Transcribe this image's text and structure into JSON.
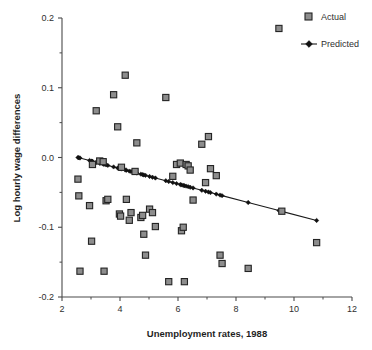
{
  "chart_data": {
    "type": "scatter",
    "title": "",
    "xlabel": "Unemployment rates, 1988",
    "ylabel": "Log hourly wage differences",
    "xlim": [
      2,
      12
    ],
    "ylim": [
      -0.2,
      0.2
    ],
    "xticks": [
      2,
      4,
      6,
      8,
      10,
      12
    ],
    "xtick_labels": [
      "2",
      "4",
      "6",
      "8",
      "10",
      "12"
    ],
    "yticks": [
      -0.2,
      -0.1,
      0.0,
      0.1,
      0.2
    ],
    "ytick_labels": [
      "-0.2",
      "-0.1",
      "0.0",
      "0.1",
      "0.2"
    ],
    "yminor_ticks": [
      -0.15,
      -0.05,
      0.05,
      0.15
    ],
    "xminor_ticks": [
      3,
      5,
      7,
      9,
      11
    ],
    "grid": false,
    "legend_position": "top-right",
    "series": [
      {
        "name": "Actual",
        "type": "scatter",
        "marker": "square",
        "marker_color": "#8d8d8d",
        "marker_edge_color": "#242424",
        "points": [
          [
            2.55,
            -0.031
          ],
          [
            2.58,
            -0.055
          ],
          [
            2.62,
            -0.163
          ],
          [
            2.95,
            -0.069
          ],
          [
            3.02,
            -0.12
          ],
          [
            3.05,
            -0.01
          ],
          [
            3.18,
            0.067
          ],
          [
            3.3,
            -0.005
          ],
          [
            3.42,
            -0.006
          ],
          [
            3.45,
            -0.163
          ],
          [
            3.52,
            -0.062
          ],
          [
            3.58,
            -0.06
          ],
          [
            3.78,
            0.09
          ],
          [
            3.92,
            0.044
          ],
          [
            3.98,
            -0.081
          ],
          [
            4.02,
            -0.084
          ],
          [
            4.05,
            -0.014
          ],
          [
            4.18,
            0.118
          ],
          [
            4.22,
            -0.06
          ],
          [
            4.32,
            -0.09
          ],
          [
            4.38,
            -0.079
          ],
          [
            4.52,
            -0.02
          ],
          [
            4.58,
            0.021
          ],
          [
            4.72,
            -0.086
          ],
          [
            4.78,
            -0.083
          ],
          [
            4.82,
            -0.11
          ],
          [
            4.88,
            -0.14
          ],
          [
            5.02,
            -0.074
          ],
          [
            5.12,
            -0.079
          ],
          [
            5.22,
            -0.099
          ],
          [
            5.58,
            0.086
          ],
          [
            5.68,
            -0.178
          ],
          [
            5.82,
            -0.027
          ],
          [
            5.95,
            -0.01
          ],
          [
            6.08,
            -0.008
          ],
          [
            6.12,
            -0.105
          ],
          [
            6.18,
            -0.1
          ],
          [
            6.22,
            -0.178
          ],
          [
            6.28,
            -0.01
          ],
          [
            6.35,
            -0.012
          ],
          [
            6.42,
            -0.018
          ],
          [
            6.52,
            -0.061
          ],
          [
            6.82,
            0.019
          ],
          [
            6.95,
            -0.036
          ],
          [
            7.05,
            0.03
          ],
          [
            7.12,
            -0.016
          ],
          [
            7.32,
            -0.026
          ],
          [
            7.45,
            -0.14
          ],
          [
            7.52,
            -0.152
          ],
          [
            8.42,
            -0.159
          ],
          [
            9.48,
            0.185
          ],
          [
            9.58,
            -0.077
          ],
          [
            10.78,
            -0.122
          ]
        ]
      },
      {
        "name": "Predicted",
        "type": "line",
        "marker": "diamond",
        "line_color": "#1a1a1a",
        "points": [
          [
            2.55,
            0.0
          ],
          [
            2.58,
            -0.0003
          ],
          [
            2.62,
            -0.0007
          ],
          [
            2.95,
            -0.0043
          ],
          [
            3.02,
            -0.0051
          ],
          [
            3.05,
            -0.0054
          ],
          [
            3.18,
            -0.0068
          ],
          [
            3.3,
            -0.0082
          ],
          [
            3.42,
            -0.0095
          ],
          [
            3.45,
            -0.0098
          ],
          [
            3.52,
            -0.0106
          ],
          [
            3.58,
            -0.0113
          ],
          [
            3.78,
            -0.0135
          ],
          [
            3.92,
            -0.015
          ],
          [
            3.98,
            -0.0157
          ],
          [
            4.02,
            -0.0161
          ],
          [
            4.05,
            -0.0165
          ],
          [
            4.18,
            -0.0179
          ],
          [
            4.22,
            -0.0183
          ],
          [
            4.32,
            -0.0195
          ],
          [
            4.38,
            -0.0201
          ],
          [
            4.52,
            -0.0217
          ],
          [
            4.58,
            -0.0223
          ],
          [
            4.72,
            -0.0239
          ],
          [
            4.78,
            -0.0245
          ],
          [
            4.82,
            -0.025
          ],
          [
            4.88,
            -0.0256
          ],
          [
            5.02,
            -0.0272
          ],
          [
            5.12,
            -0.0283
          ],
          [
            5.22,
            -0.0294
          ],
          [
            5.58,
            -0.0333
          ],
          [
            5.68,
            -0.0344
          ],
          [
            5.82,
            -0.036
          ],
          [
            5.95,
            -0.0374
          ],
          [
            6.08,
            -0.0388
          ],
          [
            6.12,
            -0.0393
          ],
          [
            6.18,
            -0.0399
          ],
          [
            6.22,
            -0.0404
          ],
          [
            6.28,
            -0.041
          ],
          [
            6.35,
            -0.0418
          ],
          [
            6.42,
            -0.0426
          ],
          [
            6.52,
            -0.0437
          ],
          [
            6.82,
            -0.047
          ],
          [
            6.95,
            -0.0484
          ],
          [
            7.05,
            -0.0495
          ],
          [
            7.12,
            -0.0503
          ],
          [
            7.32,
            -0.0525
          ],
          [
            7.45,
            -0.0539
          ],
          [
            7.52,
            -0.0547
          ],
          [
            8.42,
            -0.0645
          ],
          [
            9.48,
            -0.0761
          ],
          [
            9.58,
            -0.0772
          ],
          [
            10.78,
            -0.0903
          ]
        ]
      }
    ]
  },
  "legend": {
    "items": [
      {
        "label": "Actual",
        "marker": "square"
      },
      {
        "label": "Predicted",
        "marker": "line-diamond"
      }
    ]
  }
}
